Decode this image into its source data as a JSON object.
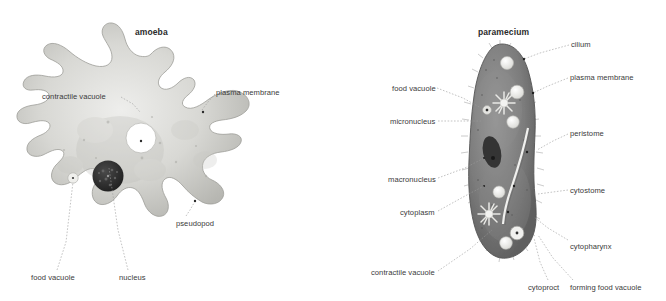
{
  "canvas": {
    "width": 666,
    "height": 301,
    "background": "#ffffff"
  },
  "figures": [
    {
      "id": "amoeba",
      "title": "amoeba",
      "title_pos": {
        "x": 135,
        "y": 27
      },
      "organism_colors": {
        "body_fill": "#cfcfcb",
        "body_edge": "#9a9a96",
        "nucleus": "#2e2e2e",
        "vacuole": "#ffffff",
        "leader_line": "#8d8d8d"
      },
      "labels": [
        {
          "name": "contractile-vacuole",
          "text": "contractile vacuole",
          "x": 42,
          "y": 92,
          "anchor": "start",
          "leader": [
            [
              121,
              97
            ],
            [
              133,
              104
            ],
            [
              140,
              112
            ]
          ]
        },
        {
          "name": "plasma-membrane",
          "text": "plasma membrane",
          "x": 216,
          "y": 88,
          "anchor": "start",
          "leader": [
            [
              215,
              94
            ],
            [
              208,
              102
            ],
            [
              202,
              110
            ]
          ]
        },
        {
          "name": "pseudopod",
          "text": "pseudopod",
          "x": 176,
          "y": 219,
          "anchor": "start",
          "leader": [
            [
              186,
              216
            ],
            [
              190,
              210
            ],
            [
              194,
              203
            ]
          ]
        },
        {
          "name": "food-vacuole",
          "text": "food vacuole",
          "x": 31,
          "y": 273,
          "anchor": "start",
          "leader": [
            [
              57,
              270
            ],
            [
              66,
              242
            ],
            [
              73,
              182
            ]
          ]
        },
        {
          "name": "nucleus",
          "text": "nucleus",
          "x": 119,
          "y": 273,
          "anchor": "start",
          "leader": [
            [
              128,
              270
            ],
            [
              118,
              230
            ],
            [
              109,
              168
            ]
          ]
        }
      ]
    },
    {
      "id": "paramecium",
      "title": "paramecium",
      "title_pos": {
        "x": 478,
        "y": 27
      },
      "organism_colors": {
        "body_fill": "#808080",
        "body_edge": "#4d4d4d",
        "macronucleus": "#3b3b3b",
        "vacuole": "#e8e8e6",
        "gullet": "#f2f2f0",
        "leader_line": "#8d8d8d"
      },
      "labels": [
        {
          "name": "cilium",
          "text": "cilium",
          "x": 571,
          "y": 40,
          "anchor": "start",
          "leader": [
            [
              569,
              45
            ],
            [
              540,
              53
            ],
            [
              524,
              59
            ]
          ]
        },
        {
          "name": "plasma-membrane",
          "text": "plasma membrane",
          "x": 570,
          "y": 73,
          "anchor": "start",
          "leader": [
            [
              568,
              78
            ],
            [
              548,
              86
            ],
            [
              533,
              93
            ]
          ]
        },
        {
          "name": "peristome",
          "text": "peristome",
          "x": 570,
          "y": 129,
          "anchor": "start",
          "leader": [
            [
              568,
              134
            ],
            [
              553,
              141
            ],
            [
              537,
              150
            ]
          ]
        },
        {
          "name": "cytostome",
          "text": "cytostome",
          "x": 570,
          "y": 186,
          "anchor": "start",
          "leader": [
            [
              568,
              190
            ],
            [
              553,
              192
            ],
            [
              538,
              194
            ]
          ]
        },
        {
          "name": "cytopharynx",
          "text": "cytopharynx",
          "x": 570,
          "y": 242,
          "anchor": "start",
          "leader": [
            [
              568,
              240
            ],
            [
              548,
              228
            ],
            [
              534,
              217
            ]
          ]
        },
        {
          "name": "cytoproct",
          "text": "cytoproct",
          "x": 528,
          "y": 283,
          "anchor": "start",
          "leader": [
            [
              548,
              280
            ],
            [
              540,
              262
            ],
            [
              534,
              238
            ]
          ]
        },
        {
          "name": "forming-food-vacuole",
          "text": "forming food vacuole",
          "x": 570,
          "y": 283,
          "anchor": "start",
          "leader": [
            [
              573,
              280
            ],
            [
              553,
              258
            ],
            [
              538,
              235
            ]
          ]
        },
        {
          "name": "food-vacuole",
          "text": "food vacuole",
          "x": 392,
          "y": 84,
          "anchor": "start",
          "leader": [
            [
              437,
              88
            ],
            [
              463,
              98
            ],
            [
              481,
              108
            ]
          ]
        },
        {
          "name": "micronucleus",
          "text": "micronucleus",
          "x": 390,
          "y": 117,
          "anchor": "start",
          "leader": [
            [
              438,
              121
            ],
            [
              462,
              121
            ],
            [
              481,
              121
            ]
          ]
        },
        {
          "name": "macronucleus",
          "text": "macronucleus",
          "x": 388,
          "y": 175,
          "anchor": "start",
          "leader": [
            [
              438,
              178
            ],
            [
              465,
              168
            ],
            [
              484,
              158
            ]
          ]
        },
        {
          "name": "cytoplasm",
          "text": "cytoplasm",
          "x": 400,
          "y": 208,
          "anchor": "start",
          "leader": [
            [
              438,
              211
            ],
            [
              465,
              196
            ],
            [
              484,
              186
            ]
          ]
        },
        {
          "name": "contractile-vacuole",
          "text": "contractile vacuole",
          "x": 371,
          "y": 268,
          "anchor": "start",
          "leader": [
            [
              438,
              271
            ],
            [
              470,
              249
            ],
            [
              492,
              230
            ]
          ]
        }
      ]
    }
  ]
}
